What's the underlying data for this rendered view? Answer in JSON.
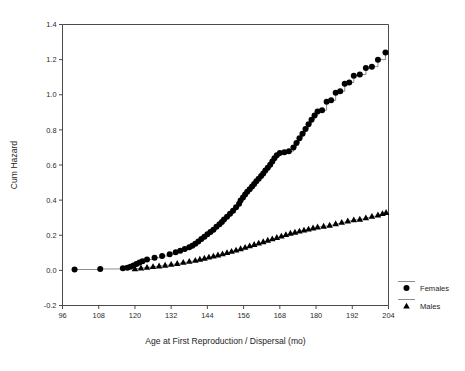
{
  "chart_data": {
    "type": "line",
    "title": "",
    "xlabel": "Age at First Reproduction / Dispersal (mo)",
    "ylabel": "Cum Hazard",
    "xlim": [
      96,
      204
    ],
    "ylim": [
      -0.2,
      1.4
    ],
    "xticks": [
      96,
      108,
      120,
      132,
      144,
      156,
      168,
      180,
      192,
      204
    ],
    "yticks": [
      -0.2,
      0.0,
      0.2,
      0.4,
      0.6,
      0.8,
      1.0,
      1.2,
      1.4
    ],
    "ytick_labels": [
      "-0.2",
      "0.0",
      "0.2",
      "0.4",
      "0.6",
      "0.8",
      "1.0",
      "1.2",
      "1.4"
    ],
    "xtick_labels": [
      "96",
      "108",
      "120",
      "132",
      "144",
      "156",
      "168",
      "180",
      "192",
      "204"
    ],
    "grid": false,
    "legend_position": "right-outside",
    "series": [
      {
        "name": "Females",
        "marker": "circle",
        "color": "#000000",
        "points": [
          [
            100.0,
            0.005
          ],
          [
            108.5,
            0.008
          ],
          [
            116.0,
            0.012
          ],
          [
            117.5,
            0.015
          ],
          [
            118.5,
            0.02
          ],
          [
            119.5,
            0.028
          ],
          [
            120.5,
            0.036
          ],
          [
            121.5,
            0.045
          ],
          [
            122.5,
            0.052
          ],
          [
            124.0,
            0.062
          ],
          [
            126.5,
            0.072
          ],
          [
            129.0,
            0.082
          ],
          [
            131.5,
            0.092
          ],
          [
            133.5,
            0.103
          ],
          [
            135.0,
            0.112
          ],
          [
            136.5,
            0.121
          ],
          [
            138.0,
            0.131
          ],
          [
            139.0,
            0.14
          ],
          [
            140.0,
            0.152
          ],
          [
            141.0,
            0.165
          ],
          [
            142.0,
            0.178
          ],
          [
            143.0,
            0.192
          ],
          [
            144.0,
            0.205
          ],
          [
            145.0,
            0.218
          ],
          [
            146.0,
            0.232
          ],
          [
            147.0,
            0.248
          ],
          [
            148.0,
            0.262
          ],
          [
            148.8,
            0.275
          ],
          [
            149.5,
            0.29
          ],
          [
            150.5,
            0.305
          ],
          [
            151.5,
            0.322
          ],
          [
            152.5,
            0.34
          ],
          [
            153.5,
            0.36
          ],
          [
            154.5,
            0.38
          ],
          [
            155.0,
            0.398
          ],
          [
            155.8,
            0.415
          ],
          [
            156.5,
            0.432
          ],
          [
            157.2,
            0.448
          ],
          [
            158.0,
            0.462
          ],
          [
            158.8,
            0.478
          ],
          [
            159.5,
            0.492
          ],
          [
            160.2,
            0.508
          ],
          [
            161.0,
            0.522
          ],
          [
            161.8,
            0.538
          ],
          [
            162.5,
            0.552
          ],
          [
            163.2,
            0.568
          ],
          [
            164.0,
            0.585
          ],
          [
            164.8,
            0.602
          ],
          [
            165.5,
            0.62
          ],
          [
            166.2,
            0.638
          ],
          [
            167.0,
            0.655
          ],
          [
            168.0,
            0.668
          ],
          [
            169.5,
            0.672
          ],
          [
            171.0,
            0.678
          ],
          [
            172.5,
            0.7
          ],
          [
            173.5,
            0.725
          ],
          [
            174.5,
            0.752
          ],
          [
            175.5,
            0.778
          ],
          [
            176.5,
            0.805
          ],
          [
            177.5,
            0.832
          ],
          [
            178.5,
            0.858
          ],
          [
            179.5,
            0.882
          ],
          [
            180.5,
            0.905
          ],
          [
            182.0,
            0.912
          ],
          [
            183.5,
            0.96
          ],
          [
            185.0,
            0.968
          ],
          [
            186.5,
            1.012
          ],
          [
            188.0,
            1.02
          ],
          [
            189.5,
            1.062
          ],
          [
            191.0,
            1.07
          ],
          [
            192.5,
            1.108
          ],
          [
            194.5,
            1.115
          ],
          [
            196.5,
            1.152
          ],
          [
            198.5,
            1.16
          ],
          [
            200.5,
            1.2
          ],
          [
            203.0,
            1.24
          ]
        ]
      },
      {
        "name": "Males",
        "marker": "triangle",
        "color": "#000000",
        "points": [
          [
            120.0,
            0.01
          ],
          [
            122.0,
            0.014
          ],
          [
            124.0,
            0.018
          ],
          [
            126.0,
            0.022
          ],
          [
            128.0,
            0.026
          ],
          [
            130.0,
            0.03
          ],
          [
            132.0,
            0.035
          ],
          [
            134.0,
            0.04
          ],
          [
            136.0,
            0.046
          ],
          [
            138.0,
            0.052
          ],
          [
            140.0,
            0.058
          ],
          [
            141.5,
            0.064
          ],
          [
            143.0,
            0.07
          ],
          [
            144.5,
            0.076
          ],
          [
            146.0,
            0.082
          ],
          [
            147.5,
            0.088
          ],
          [
            149.0,
            0.095
          ],
          [
            150.5,
            0.102
          ],
          [
            152.0,
            0.109
          ],
          [
            153.5,
            0.116
          ],
          [
            155.0,
            0.124
          ],
          [
            156.5,
            0.132
          ],
          [
            158.0,
            0.14
          ],
          [
            159.5,
            0.148
          ],
          [
            161.0,
            0.156
          ],
          [
            162.5,
            0.164
          ],
          [
            164.0,
            0.172
          ],
          [
            165.5,
            0.18
          ],
          [
            167.0,
            0.188
          ],
          [
            168.5,
            0.196
          ],
          [
            170.0,
            0.204
          ],
          [
            171.5,
            0.212
          ],
          [
            173.0,
            0.218
          ],
          [
            174.5,
            0.224
          ],
          [
            176.0,
            0.23
          ],
          [
            177.5,
            0.236
          ],
          [
            179.0,
            0.242
          ],
          [
            180.5,
            0.248
          ],
          [
            182.5,
            0.252
          ],
          [
            184.5,
            0.258
          ],
          [
            186.5,
            0.266
          ],
          [
            188.5,
            0.274
          ],
          [
            190.5,
            0.282
          ],
          [
            192.5,
            0.288
          ],
          [
            194.5,
            0.292
          ],
          [
            196.5,
            0.3
          ],
          [
            198.5,
            0.308
          ],
          [
            200.5,
            0.316
          ],
          [
            202.0,
            0.324
          ],
          [
            203.2,
            0.33
          ]
        ]
      }
    ]
  },
  "legend": {
    "entries": [
      {
        "label": "Females",
        "marker": "circle"
      },
      {
        "label": "Males",
        "marker": "triangle"
      }
    ]
  }
}
